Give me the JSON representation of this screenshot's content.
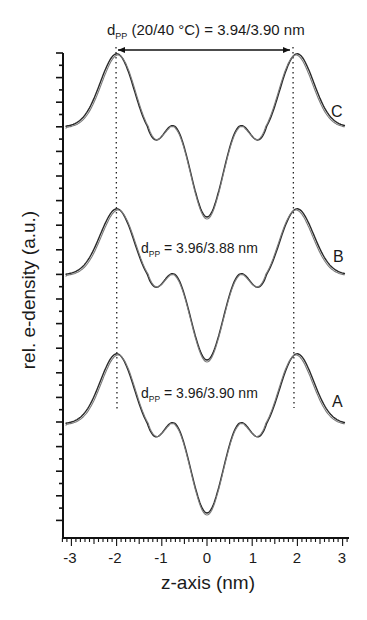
{
  "chart_data": {
    "type": "line",
    "title_parts": {
      "main": "d",
      "sub": "PP",
      "rest": " (20/40 °C) = 3.94/3.90 nm"
    },
    "xlabel": "z-axis (nm)",
    "ylabel": "rel. e-density (a.u.)",
    "xlim": [
      -3.2,
      3.1
    ],
    "x_ticks": [
      "-3",
      "-2",
      "-1",
      "0",
      "1",
      "2",
      "3"
    ],
    "x_tick_values": [
      -3,
      -2,
      -1,
      0,
      1,
      2,
      3
    ],
    "y_ticks_labeled": false,
    "grid": false,
    "legend": "none (curves labeled inline A, B, C)",
    "series": [
      {
        "name": "C",
        "label": "C",
        "annotation": "d_PP (20/40 °C) = 3.94/3.90 nm",
        "offset_level": "top",
        "note": "two overlaid curves (20 °C and 40 °C)",
        "key_points": [
          {
            "x": -3.1,
            "y": 0.0
          },
          {
            "x": -1.97,
            "y": 1.0
          },
          {
            "x": -1.25,
            "y": -0.5
          },
          {
            "x": -0.8,
            "y": -0.47
          },
          {
            "x": 0.0,
            "y": -1.27
          },
          {
            "x": 0.8,
            "y": -0.47
          },
          {
            "x": 1.25,
            "y": -0.5
          },
          {
            "x": 1.97,
            "y": 1.0
          },
          {
            "x": 3.05,
            "y": 0.0
          }
        ]
      },
      {
        "name": "B",
        "label": "B",
        "annotation": "d_PP = 3.96/3.88 nm",
        "offset_level": "middle",
        "note": "two overlaid curves (20 °C and 40 °C)",
        "key_points": [
          {
            "x": -3.1,
            "y": 0.0
          },
          {
            "x": -1.98,
            "y": 1.0
          },
          {
            "x": -1.25,
            "y": -0.5
          },
          {
            "x": -0.8,
            "y": -0.47
          },
          {
            "x": 0.0,
            "y": -1.27
          },
          {
            "x": 0.8,
            "y": -0.47
          },
          {
            "x": 1.25,
            "y": -0.5
          },
          {
            "x": 1.96,
            "y": 1.0
          },
          {
            "x": 3.05,
            "y": 0.0
          }
        ]
      },
      {
        "name": "A",
        "label": "A",
        "annotation": "d_PP = 3.96/3.90 nm",
        "offset_level": "bottom",
        "note": "two overlaid curves (20 °C and 40 °C)",
        "key_points": [
          {
            "x": -3.1,
            "y": 0.0
          },
          {
            "x": -1.98,
            "y": 1.0
          },
          {
            "x": -1.25,
            "y": -0.5
          },
          {
            "x": -0.8,
            "y": -0.47
          },
          {
            "x": 0.0,
            "y": -1.3
          },
          {
            "x": 0.8,
            "y": -0.47
          },
          {
            "x": 1.25,
            "y": -0.5
          },
          {
            "x": 1.97,
            "y": 1.0
          },
          {
            "x": 3.05,
            "y": 0.0
          }
        ]
      }
    ],
    "reference_lines": [
      {
        "type": "vertical-dotted",
        "x": -2.0
      },
      {
        "type": "vertical-dotted",
        "x": 1.95
      }
    ],
    "arrow": {
      "type": "double-headed",
      "from_x": -2.0,
      "to_x": 1.95,
      "meaning": "peak-to-peak distance d_PP"
    }
  },
  "labels": {
    "title_main": "d",
    "title_sub": "PP",
    "title_rest": " (20/40 °C) = 3.94/3.90 nm",
    "annB_main": "d",
    "annB_sub": "PP",
    "annB_rest": " = 3.96/3.88 nm",
    "annA_main": "d",
    "annA_sub": "PP",
    "annA_rest": " = 3.96/3.90 nm",
    "curveC": "C",
    "curveB": "B",
    "curveA": "A",
    "xlabel": "z-axis (nm)",
    "ylabel": "rel. e-density (a.u.)",
    "xtick0": "-3",
    "xtick1": "-2",
    "xtick2": "-1",
    "xtick3": "0",
    "xtick4": "1",
    "xtick5": "2",
    "xtick6": "3"
  },
  "colors": {
    "line": "#2a2a2a",
    "line_secondary": "#7a7a7a",
    "axis": "#111111",
    "background": "#ffffff"
  }
}
